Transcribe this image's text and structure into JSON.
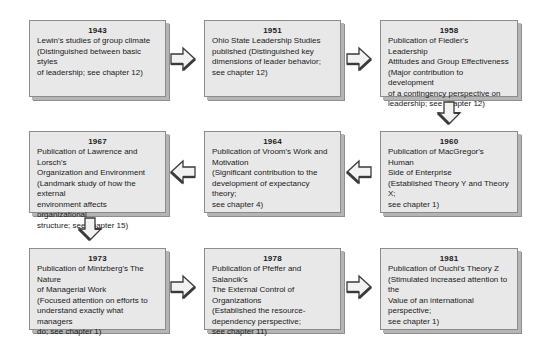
{
  "diagram": {
    "palette": {
      "box_fill": "#e8e8e8",
      "box_border": "#8c8c8c",
      "shadow": "#b5b5b5",
      "arrow_fill": "#f2f2f2",
      "arrow_stroke": "#3a3a3a",
      "text": "#1a1a1a",
      "background": "#ffffff"
    },
    "nodes": [
      {
        "id": "node-1943",
        "year": "1943",
        "text": "Lewin's studies of group climate\n(Distinguished between basic styles\nof leadership; see chapter 12)"
      },
      {
        "id": "node-1951",
        "year": "1951",
        "text": "Ohio State Leadership Studies\npublished (Distinguished key\ndimensions of leader behavior;\nsee chapter 12)"
      },
      {
        "id": "node-1958",
        "year": "1958",
        "text": "Publication of Fiedler's Leadership\nAttitudes and Group Effectiveness\n(Major contribution to development\nof a contingency perspective on\nleadership; see chapter 12)"
      },
      {
        "id": "node-1967",
        "year": "1967",
        "text": "Publication of Lawrence and Lorsch's\nOrganization and Environment\n(Landmark study of how the external\nenvironment affects organizational\nstructure; see chapter 15)"
      },
      {
        "id": "node-1964",
        "year": "1964",
        "text": "Publication of Vroom's Work and\nMotivation\n(Significant contribution to the\ndevelopment of expectancy theory;\nsee chapter 4)"
      },
      {
        "id": "node-1960",
        "year": "1960",
        "text": "Publication of MacGregor's Human\nSide of Enterprise\n(Established Theory Y and Theory X;\nsee chapter 1)"
      },
      {
        "id": "node-1973",
        "year": "1973",
        "text": "Publication of Mintzberg's The Nature\nof Managerial Work\n(Focused attention on efforts to\nunderstand exactly what managers\ndo; see chapter 1)"
      },
      {
        "id": "node-1978",
        "year": "1978",
        "text": "Publication of Pfeffer and Salancik's\nThe External Control of Organizations\n(Established the resource-\ndependency perspective;\nsee chapter 11)"
      },
      {
        "id": "node-1981",
        "year": "1981",
        "text": "Publication of Ouchi's Theory Z\n(Stimulated increased attention to the\nValue of an international perspective;\nsee chapter 1)"
      }
    ],
    "connectors": [
      {
        "id": "arrow-1943-to-1951",
        "direction": "right"
      },
      {
        "id": "arrow-1951-to-1958",
        "direction": "right"
      },
      {
        "id": "arrow-1958-to-1960",
        "direction": "down"
      },
      {
        "id": "arrow-1960-to-1964",
        "direction": "left"
      },
      {
        "id": "arrow-1964-to-1967",
        "direction": "left"
      },
      {
        "id": "arrow-1967-to-1973",
        "direction": "down"
      },
      {
        "id": "arrow-1973-to-1978",
        "direction": "right"
      },
      {
        "id": "arrow-1978-to-1981",
        "direction": "right"
      }
    ]
  }
}
